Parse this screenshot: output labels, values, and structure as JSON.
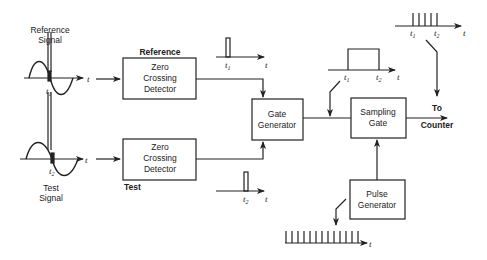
{
  "diagram": {
    "type": "block-diagram",
    "title": "",
    "inputs": {
      "reference": {
        "label_line1": "Reference",
        "label_line2": "Signal",
        "time_marker": "t",
        "time_sub": "1",
        "axis": "t"
      },
      "test": {
        "label_line1": "Test",
        "label_line2": "Signal",
        "time_marker": "t",
        "time_sub": "2",
        "axis": "t"
      }
    },
    "blocks": [
      {
        "id": "zcd-ref",
        "line1": "Zero",
        "line2": "Crossing",
        "line3": "Detector",
        "tag": "Reference"
      },
      {
        "id": "zcd-test",
        "line1": "Zero",
        "line2": "Crossing",
        "line3": "Detector",
        "tag": "Test"
      },
      {
        "id": "gate-gen",
        "line1": "Gate",
        "line2": "Generator"
      },
      {
        "id": "sampling-gate",
        "line1": "Sampling",
        "line2": "Gate"
      },
      {
        "id": "pulse-gen",
        "line1": "Pulse",
        "line2": "Generator"
      }
    ],
    "waveforms": {
      "ref_pulse": {
        "marker": "t",
        "sub": "1",
        "axis": "t"
      },
      "test_pulse": {
        "marker": "t",
        "sub": "2",
        "axis": "t"
      },
      "gate": {
        "m1": "t",
        "s1": "1",
        "m2": "t",
        "s2": "2",
        "axis": "t"
      },
      "output": {
        "m1": "t",
        "s1": "1",
        "m2": "t",
        "s2": "2",
        "axis": "t",
        "pulse_count": 5
      },
      "clock": {
        "axis": "t",
        "pulse_count": 13
      }
    },
    "output": {
      "line1": "To",
      "line2": "Counter"
    }
  }
}
